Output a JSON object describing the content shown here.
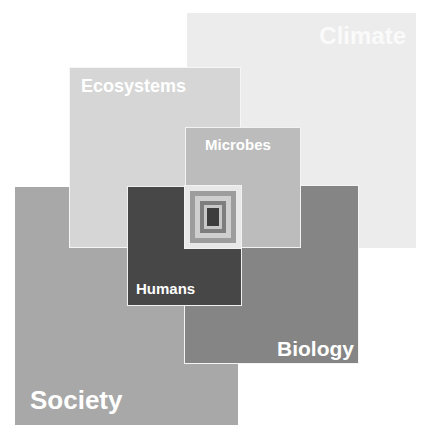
{
  "diagram": {
    "boxes": [
      {
        "id": "climate",
        "label": "Climate",
        "color": "#ececec"
      },
      {
        "id": "society",
        "label": "Society",
        "color": "#a8a8a8"
      },
      {
        "id": "biology",
        "label": "Biology",
        "color": "#858585"
      },
      {
        "id": "ecosystems",
        "label": "Ecosystems",
        "color": "#d6d6d6"
      },
      {
        "id": "humans",
        "label": "Humans",
        "color": "#474747"
      },
      {
        "id": "microbes",
        "label": "Microbes",
        "color": "#bcbcbc"
      }
    ],
    "center_target": {
      "rings": [
        "#e8e8e8",
        "#9d9d9d",
        "#cfcfcf",
        "#7e7e7e",
        "#c8c8c8",
        "#3d3d3d"
      ]
    }
  }
}
